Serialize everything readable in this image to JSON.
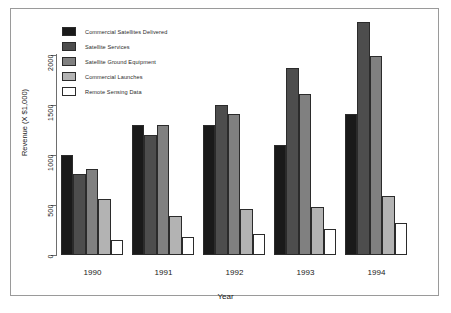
{
  "chart_data": {
    "type": "bar",
    "title": "",
    "xlabel": "Year",
    "ylabel": "Revenue (X $1,000)",
    "categories": [
      "1990",
      "1991",
      "1992",
      "1993",
      "1994"
    ],
    "ylim": [
      0,
      2400
    ],
    "yticks": [
      0,
      500,
      1000,
      1500,
      2000
    ],
    "ytick_labels": [
      "0",
      "500",
      "1000",
      "1500",
      "2000"
    ],
    "grid": false,
    "legend_position": "top-left inside plot",
    "series": [
      {
        "name": "Commercial Satellites Delivered",
        "color": "#1a1a1a",
        "values": [
          1000,
          1300,
          1300,
          1100,
          1410
        ]
      },
      {
        "name": "Satellite Services",
        "color": "#4d4d4d",
        "values": [
          810,
          1200,
          1500,
          1870,
          2330
        ]
      },
      {
        "name": "Satellite Ground Equipment",
        "color": "#808080",
        "values": [
          860,
          1300,
          1410,
          1610,
          1990
        ]
      },
      {
        "name": "Commercial Launches",
        "color": "#b3b3b3",
        "values": [
          565,
          390,
          460,
          480,
          590
        ]
      },
      {
        "name": "Remote Sensing Data",
        "color": "#ffffff",
        "values": [
          150,
          185,
          215,
          265,
          320
        ]
      }
    ]
  }
}
